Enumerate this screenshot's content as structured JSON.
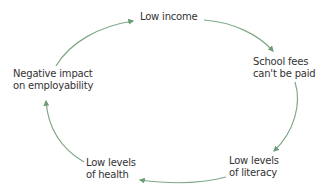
{
  "diagram": {
    "type": "cycle",
    "arrow_color": "#6e9e78",
    "text_color": "#333333",
    "nodes": [
      {
        "id": "low-income",
        "lines": [
          "Low income"
        ]
      },
      {
        "id": "school-fees",
        "lines": [
          "School fees",
          "can't be paid"
        ]
      },
      {
        "id": "low-literacy",
        "lines": [
          "Low levels",
          "of literacy"
        ]
      },
      {
        "id": "low-health",
        "lines": [
          "Low levels",
          "of health"
        ]
      },
      {
        "id": "negative-impact",
        "lines": [
          "Negative impact",
          "on employability"
        ]
      }
    ],
    "edges": [
      {
        "from": "low-income",
        "to": "school-fees"
      },
      {
        "from": "school-fees",
        "to": "low-literacy"
      },
      {
        "from": "low-literacy",
        "to": "low-health"
      },
      {
        "from": "low-health",
        "to": "negative-impact"
      },
      {
        "from": "negative-impact",
        "to": "low-income"
      }
    ]
  }
}
